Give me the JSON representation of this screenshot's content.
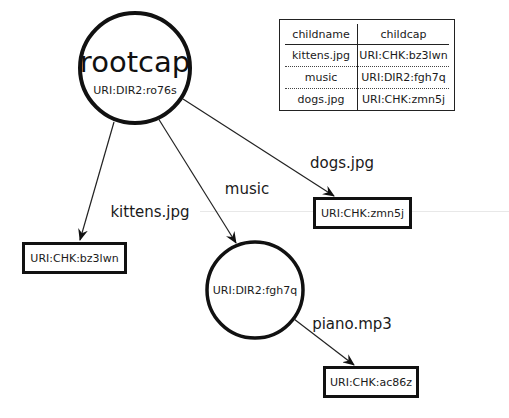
{
  "root": {
    "title": "rootcap",
    "uri": "URI:DIR2:ro76s"
  },
  "music_dir": {
    "uri": "URI:DIR2:fgh7q"
  },
  "files": {
    "kittens": {
      "uri": "URI:CHK:bz3lwn"
    },
    "dogs": {
      "uri": "URI:CHK:zmn5j"
    },
    "piano": {
      "uri": "URI:CHK:ac86z"
    }
  },
  "edges": {
    "kittens": "kittens.jpg",
    "music": "music",
    "dogs": "dogs.jpg",
    "piano": "piano.mp3"
  },
  "table": {
    "headers": [
      "childname",
      "childcap"
    ],
    "rows": [
      [
        "kittens.jpg",
        "URI:CHK:bz3lwn"
      ],
      [
        "music",
        "URI:DIR2:fgh7q"
      ],
      [
        "dogs.jpg",
        "URI:CHK:zmn5j"
      ]
    ]
  }
}
